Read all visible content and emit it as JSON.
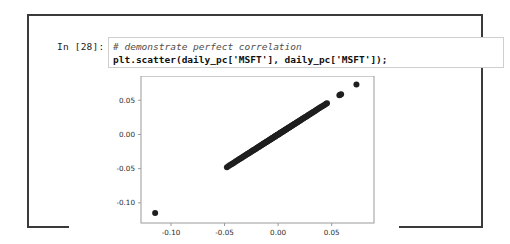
{
  "notebook": {
    "prompt": "In [28]:",
    "code": {
      "comment": "# demonstrate perfect correlation",
      "statement": "plt.scatter(daily_pc['MSFT'], daily_pc['MSFT']);"
    }
  },
  "colors": {
    "cell_border": "#3a3a3a",
    "code_box_border": "#cfcfcf",
    "marker": "#1f1f1f",
    "axis": "#9a9a9a",
    "background": "#ffffff"
  },
  "chart_data": {
    "type": "scatter",
    "title": "",
    "xlabel": "",
    "ylabel": "",
    "xlim": [
      -0.128,
      0.0895
    ],
    "ylim": [
      -0.1295,
      0.0855
    ],
    "xticks": [
      -0.1,
      -0.05,
      0.0,
      0.05
    ],
    "xtick_labels": [
      "-0.10",
      "-0.05",
      "0.00",
      "0.05"
    ],
    "yticks": [
      0.05,
      0.0,
      -0.05,
      -0.1
    ],
    "ytick_labels": [
      "0.05",
      "0.00",
      "-0.05",
      "-0.10"
    ],
    "grid": false,
    "legend": null,
    "marker_color": "#1f1f1f",
    "marker_size": 3.0,
    "series": [
      {
        "name": "MSFT vs MSFT",
        "relation": "y = x (perfect correlation)",
        "x": [
          -0.1148,
          -0.0478,
          -0.0462,
          -0.0448,
          -0.0436,
          -0.0424,
          -0.0412,
          -0.04,
          -0.0389,
          -0.0378,
          -0.0367,
          -0.0357,
          -0.0347,
          -0.0337,
          -0.0327,
          -0.0318,
          -0.0309,
          -0.03,
          -0.0291,
          -0.0283,
          -0.0275,
          -0.0267,
          -0.0259,
          -0.0251,
          -0.0244,
          -0.0236,
          -0.0229,
          -0.0222,
          -0.0215,
          -0.0208,
          -0.0201,
          -0.0195,
          -0.0188,
          -0.0182,
          -0.0176,
          -0.017,
          -0.0164,
          -0.0158,
          -0.0152,
          -0.0146,
          -0.0141,
          -0.0135,
          -0.013,
          -0.0124,
          -0.0119,
          -0.0114,
          -0.0109,
          -0.0104,
          -0.0099,
          -0.0094,
          -0.0089,
          -0.0084,
          -0.008,
          -0.0075,
          -0.007,
          -0.0066,
          -0.0061,
          -0.0057,
          -0.0053,
          -0.0048,
          -0.0044,
          -0.004,
          -0.0036,
          -0.0032,
          -0.0028,
          -0.0024,
          -0.002,
          -0.0016,
          -0.0012,
          -0.0008,
          -0.0004,
          0.0,
          0.0004,
          0.0008,
          0.0012,
          0.0016,
          0.002,
          0.0024,
          0.0028,
          0.0032,
          0.0036,
          0.004,
          0.0044,
          0.0048,
          0.0053,
          0.0057,
          0.0061,
          0.0066,
          0.007,
          0.0075,
          0.008,
          0.0084,
          0.0089,
          0.0094,
          0.0099,
          0.0104,
          0.0109,
          0.0114,
          0.0119,
          0.0124,
          0.013,
          0.0135,
          0.0141,
          0.0146,
          0.0152,
          0.0158,
          0.0164,
          0.017,
          0.0176,
          0.0182,
          0.0188,
          0.0195,
          0.0201,
          0.0208,
          0.0215,
          0.0222,
          0.0229,
          0.0236,
          0.0244,
          0.0251,
          0.0259,
          0.0267,
          0.0275,
          0.0283,
          0.0291,
          0.03,
          0.0309,
          0.0318,
          0.0327,
          0.0337,
          0.0347,
          0.0357,
          0.0367,
          0.0378,
          0.0389,
          0.04,
          0.0412,
          0.0424,
          0.0436,
          0.0448,
          0.0456,
          0.0572,
          0.058,
          0.0588,
          0.0731
        ],
        "y": [
          -0.1148,
          -0.0478,
          -0.0462,
          -0.0448,
          -0.0436,
          -0.0424,
          -0.0412,
          -0.04,
          -0.0389,
          -0.0378,
          -0.0367,
          -0.0357,
          -0.0347,
          -0.0337,
          -0.0327,
          -0.0318,
          -0.0309,
          -0.03,
          -0.0291,
          -0.0283,
          -0.0275,
          -0.0267,
          -0.0259,
          -0.0251,
          -0.0244,
          -0.0236,
          -0.0229,
          -0.0222,
          -0.0215,
          -0.0208,
          -0.0201,
          -0.0195,
          -0.0188,
          -0.0182,
          -0.0176,
          -0.017,
          -0.0164,
          -0.0158,
          -0.0152,
          -0.0146,
          -0.0141,
          -0.0135,
          -0.013,
          -0.0124,
          -0.0119,
          -0.0114,
          -0.0109,
          -0.0104,
          -0.0099,
          -0.0094,
          -0.0089,
          -0.0084,
          -0.008,
          -0.0075,
          -0.007,
          -0.0066,
          -0.0061,
          -0.0057,
          -0.0053,
          -0.0048,
          -0.0044,
          -0.004,
          -0.0036,
          -0.0032,
          -0.0028,
          -0.0024,
          -0.002,
          -0.0016,
          -0.0012,
          -0.0008,
          -0.0004,
          0.0,
          0.0004,
          0.0008,
          0.0012,
          0.0016,
          0.002,
          0.0024,
          0.0028,
          0.0032,
          0.0036,
          0.004,
          0.0044,
          0.0048,
          0.0053,
          0.0057,
          0.0061,
          0.0066,
          0.007,
          0.0075,
          0.008,
          0.0084,
          0.0089,
          0.0094,
          0.0099,
          0.0104,
          0.0109,
          0.0114,
          0.0119,
          0.0124,
          0.013,
          0.0135,
          0.0141,
          0.0146,
          0.0152,
          0.0158,
          0.0164,
          0.017,
          0.0176,
          0.0182,
          0.0188,
          0.0195,
          0.0201,
          0.0208,
          0.0215,
          0.0222,
          0.0229,
          0.0236,
          0.0244,
          0.0251,
          0.0259,
          0.0267,
          0.0275,
          0.0283,
          0.0291,
          0.03,
          0.0309,
          0.0318,
          0.0327,
          0.0337,
          0.0347,
          0.0357,
          0.0367,
          0.0378,
          0.0389,
          0.04,
          0.0412,
          0.0424,
          0.0436,
          0.0448,
          0.0456,
          0.0572,
          0.058,
          0.0588,
          0.0731
        ]
      }
    ]
  }
}
